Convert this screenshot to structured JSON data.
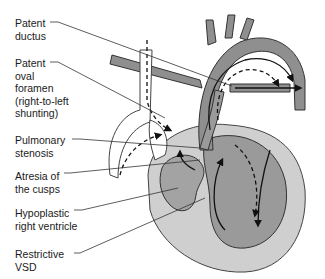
{
  "diagram": {
    "labels": [
      {
        "id": "patent-ductus",
        "text": "Patent\nductus"
      },
      {
        "id": "patent-oval-foramen",
        "text": "Patent\noval\nforamen\n(right-to-left\nshunting)"
      },
      {
        "id": "pulmonary-stenosis",
        "text": "Pulmonary\nstenosis"
      },
      {
        "id": "atresia-of-cusps",
        "text": "Atresia of\nthe cusps"
      },
      {
        "id": "hypoplastic-right-ventricle",
        "text": "Hypoplastic\nright ventricle"
      },
      {
        "id": "restrictive-vsd",
        "text": "Restrictive\nVSD"
      }
    ],
    "colors": {
      "vessel_fill": "#8f8f8f",
      "vessel_outline": "#3a3a3a",
      "heart_outer": "#c9c9c9",
      "heart_inner": "#9a9a9a",
      "rv_fill": "#9d9d9d",
      "leader_line": "#333333",
      "arrow": "#111111"
    }
  }
}
